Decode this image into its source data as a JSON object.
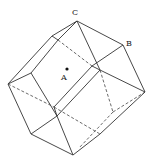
{
  "diagram": {
    "title": "",
    "labels": {
      "A": "A",
      "B": "B",
      "C": "C"
    },
    "points": {
      "A": {
        "x": 67,
        "y": 69,
        "marked": true
      }
    },
    "colors": {
      "line": "#333333",
      "background": "#ffffff"
    }
  }
}
